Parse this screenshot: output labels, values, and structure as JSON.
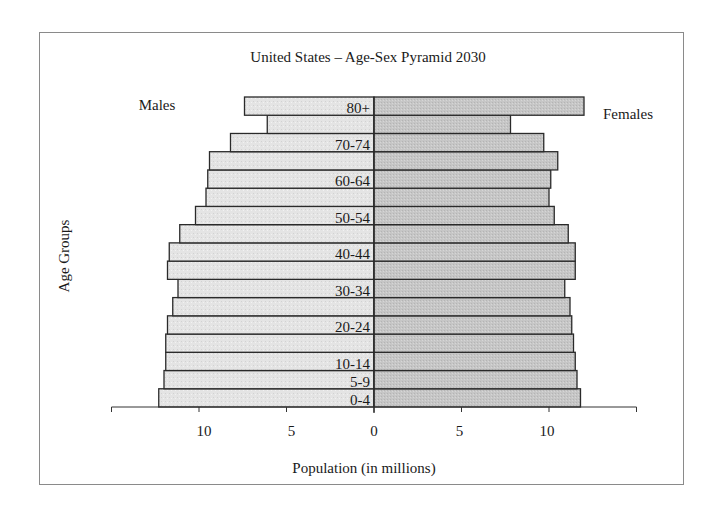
{
  "chart_data": {
    "type": "bar",
    "orientation": "horizontal",
    "subtype": "population-pyramid",
    "title": "United States – Age-Sex Pyramid 2030",
    "xlabel": "Population (in millions)",
    "ylabel": "Age Groups",
    "xlim": [
      -15,
      15
    ],
    "xticks": [
      {
        "value": -10,
        "label": "10"
      },
      {
        "value": -5,
        "label": "5"
      },
      {
        "value": 0,
        "label": "0"
      },
      {
        "value": 5,
        "label": "5"
      },
      {
        "value": 10,
        "label": "10"
      }
    ],
    "grid": false,
    "categories": [
      "0-4",
      "5-9",
      "10-14",
      "15-19",
      "20-24",
      "25-29",
      "30-34",
      "35-39",
      "40-44",
      "45-49",
      "50-54",
      "55-59",
      "60-64",
      "65-69",
      "70-74",
      "75-79",
      "80+"
    ],
    "category_labels_shown": [
      "0-4",
      "5-9",
      "10-14",
      "",
      "20-24",
      "",
      "30-34",
      "",
      "40-44",
      "",
      "50-54",
      "",
      "60-64",
      "",
      "70-74",
      "",
      "80+"
    ],
    "series": [
      {
        "name": "Males",
        "side": "left",
        "color": "#e4e4e4",
        "values": [
          12.3,
          12.0,
          11.9,
          11.9,
          11.8,
          11.5,
          11.2,
          11.8,
          11.7,
          11.1,
          10.2,
          9.6,
          9.5,
          9.4,
          8.2,
          6.1,
          7.4
        ]
      },
      {
        "name": "Females",
        "side": "right",
        "color": "#c6c6c6",
        "values": [
          11.8,
          11.6,
          11.5,
          11.4,
          11.3,
          11.2,
          10.9,
          11.5,
          11.5,
          11.1,
          10.3,
          10.0,
          10.1,
          10.5,
          9.7,
          7.8,
          12.0
        ]
      }
    ],
    "series_labels": {
      "males": "Males",
      "females": "Females"
    },
    "bar_outline_color": "#2a2a2a"
  }
}
